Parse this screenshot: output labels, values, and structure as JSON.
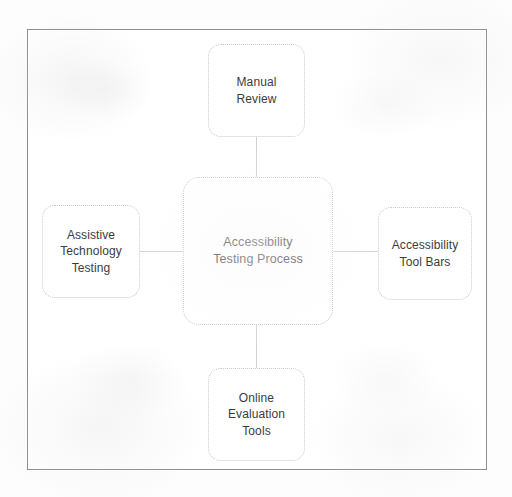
{
  "diagram": {
    "title": "Accessibility Testing Process",
    "type": "hub-and-spoke",
    "center_node": {
      "id": "accessibility-testing-process",
      "label": "Accessibility\nTesting Process"
    },
    "spoke_nodes": [
      {
        "id": "manual-review",
        "position": "top",
        "label": "Manual\nReview"
      },
      {
        "id": "accessibility-tool-bars",
        "position": "right",
        "label": "Accessibility\nTool Bars"
      },
      {
        "id": "online-evaluation-tools",
        "position": "bottom",
        "label": "Online\nEvaluation\nTools"
      },
      {
        "id": "assistive-technology-testing",
        "position": "left",
        "label": "Assistive\nTechnology\nTesting"
      }
    ],
    "colors": {
      "page_background": "#fdfdfd",
      "frame_border": "#8b8b90",
      "node_border": "#c9c9cf",
      "node_fill": "#ffffff",
      "connector": "#d2d2d6",
      "text": "#3c3c40"
    }
  }
}
